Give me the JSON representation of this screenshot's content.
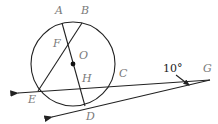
{
  "diagram": {
    "type": "geometry",
    "circle": {
      "center_label": "O",
      "cx": 73,
      "cy": 64,
      "r": 42
    },
    "points": [
      {
        "label": "A",
        "x": 62,
        "y": 23,
        "lx": 55,
        "ly": 14
      },
      {
        "label": "B",
        "x": 82,
        "y": 23,
        "lx": 81,
        "ly": 14
      },
      {
        "label": "F",
        "x": 67,
        "y": 44,
        "lx": 53,
        "ly": 47
      },
      {
        "label": "O",
        "x": 73,
        "y": 64,
        "lx": 79,
        "ly": 59
      },
      {
        "label": "H",
        "x": 79,
        "y": 86,
        "lx": 82,
        "ly": 82
      },
      {
        "label": "C",
        "x": 114,
        "y": 83,
        "lx": 119,
        "ly": 77
      },
      {
        "label": "E",
        "x": 38,
        "y": 91,
        "lx": 28,
        "ly": 103
      },
      {
        "label": "D",
        "x": 85,
        "y": 106,
        "lx": 86,
        "ly": 120
      },
      {
        "label": "G",
        "x": 210,
        "y": 80,
        "lx": 203,
        "ly": 72
      }
    ],
    "angle_annotation": {
      "text": "10°",
      "x": 163,
      "y": 72
    }
  }
}
